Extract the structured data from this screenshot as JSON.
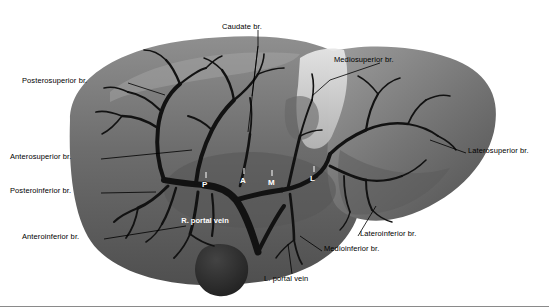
{
  "figure": {
    "title": "",
    "background": "#ffffff",
    "colors": {
      "liver_dark": "#5f5f5f",
      "liver_mid": "#6e6e6e",
      "liver_light": "#8c8c8c",
      "liver_highlight": "#bdbdbd",
      "falciform_pale": "#d9d9d9",
      "vessel_dark": "#141414",
      "gallbladder": "#2b2b2b",
      "leader_line": "#000000",
      "label_text": "#000000",
      "inner_text": "#ffffff"
    }
  },
  "labels": {
    "caudate": "Caudate br.",
    "mediosuperior": "Mediosuperior br.",
    "posterosuperior": "Posterosuperior br.",
    "anterosuperior": "Anterosuperior br.",
    "posteroinferior": "Posteroinferior br.",
    "anteroinferior": "Anteroinferior br.",
    "laterosuperior": "Laterosuperior br.",
    "lateroinferior": "Lateroinferior br.",
    "medioinferior": "Medioinferior br.",
    "l_portal_vein": "L. portal vein",
    "r_portal_vein": "R. portal vein"
  },
  "inner_marks": {
    "p": "P",
    "a": "A",
    "m": "M",
    "l": "L"
  }
}
